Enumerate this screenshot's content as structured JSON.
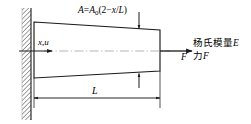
{
  "diagram": {
    "colors": {
      "line": "#1a1a1a",
      "hatch": "#555555",
      "centerline": "#9a9a9a",
      "background": "#ffffff"
    },
    "labels": {
      "area_formula": {
        "full": "A=A0(2-x/L)",
        "var": "A",
        "equals": "=",
        "base_var": "A",
        "subscript": "0",
        "expr_open": "(2",
        "minus": "−",
        "x": "x",
        "slash": "/",
        "L": "L",
        "expr_close": ")"
      },
      "axis_label": "x,u",
      "axis_label_x": "x",
      "axis_label_comma": ",",
      "axis_label_u": "u",
      "force_symbol": "F",
      "length_symbol": "L",
      "youngs_modulus": "杨氏模量",
      "youngs_modulus_symbol": "E",
      "force_text": "力",
      "force_text_symbol": "F"
    },
    "geometry": {
      "wall_x": 22,
      "wall_width": 9,
      "wall_top": 8,
      "wall_bottom": 120,
      "bar_left": 34,
      "bar_right": 160,
      "bar_left_top": 22,
      "bar_left_bottom": 78,
      "bar_right_top": 30,
      "bar_right_bottom": 71,
      "centerline_y": 51,
      "dimension_y": 98,
      "dimension_left": 34,
      "dimension_right": 160
    },
    "icons": {
      "axis_arrow": "arrow-right-icon",
      "force_arrow": "arrow-right-icon",
      "leader_down": "arrow-down-icon",
      "leader_up": "arrow-up-icon",
      "dimension_arrows": "dimension-arrow-icon"
    }
  }
}
